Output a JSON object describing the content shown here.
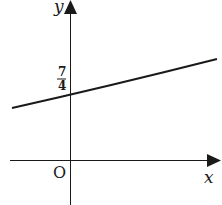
{
  "diagram": {
    "type": "coordinate-graph",
    "axes": {
      "x_label": "x",
      "y_label": "y",
      "origin_label": "O"
    },
    "intercept_label": {
      "numerator": "7",
      "denominator": "4"
    },
    "line": {
      "description": "straight line with positive slope crossing y-axis at 7/4",
      "y_intercept": "7/4"
    },
    "colors": {
      "ink": "#1a1a1a",
      "background": "#ffffff"
    }
  }
}
